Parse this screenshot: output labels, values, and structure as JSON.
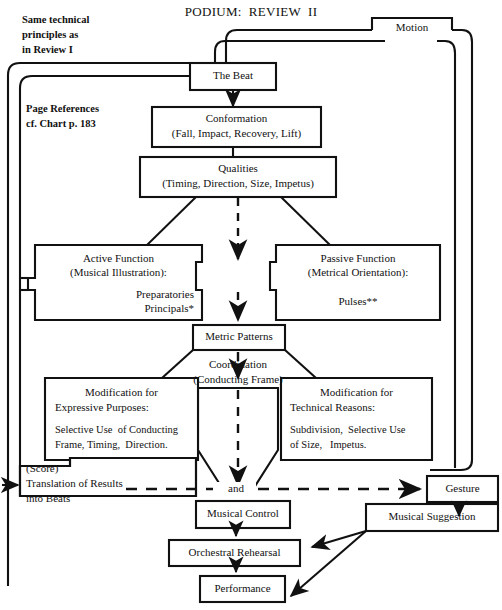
{
  "title": "PODIUM:  REVIEW  II",
  "notes": [
    {
      "id": "same-technical-principles",
      "text": "Same technical\nprinciples as\nin Review I"
    },
    {
      "id": "page-references",
      "text": "Page References\ncf. Chart p. 183"
    }
  ],
  "nodes": {
    "motion": {
      "label": "Motion"
    },
    "the_beat": {
      "label": "The Beat"
    },
    "conformation": {
      "line1": "Conformation",
      "line2": "(Fall, Impact, Recovery, Lift)"
    },
    "qualities": {
      "line1": "Qualities",
      "line2": "(Timing, Direction, Size, Impetus)"
    },
    "active_function": {
      "line1": "Active Function",
      "line2": "(Musical Illustration):",
      "line3": "Preparatories",
      "line4": "Principals*"
    },
    "passive_function": {
      "line1": "Passive Function",
      "line2": "(Metrical Orientation):",
      "line3": "Pulses**"
    },
    "metric_patterns": {
      "label": "Metric Patterns"
    },
    "coordination": {
      "line1": "Coordination",
      "line2": "(Conducting Frame)"
    },
    "modification_expressive": {
      "line1": "Modification for",
      "line2": "Expressive Purposes:",
      "line3": "Selective Use  of Conducting",
      "line4": "Frame, Timing,  Direction."
    },
    "modification_technical": {
      "line1": "Modification for",
      "line2": "Technical Reasons:",
      "line3": "Subdivision,  Selective Use",
      "line4": "of Size,   Impetus."
    },
    "score_translation": {
      "line1": "(Score)",
      "line2": "Translation of Results",
      "line3": "into Beats"
    },
    "and_junction": {
      "label": "and"
    },
    "musical_control": {
      "label": "Musical Control"
    },
    "gesture": {
      "label": "Gesture"
    },
    "musical_suggestion": {
      "label": "Musical Suggestion"
    },
    "orchestral_rehearsal": {
      "label": "Orchestral Rehearsal"
    },
    "performance": {
      "label": "Performance"
    }
  },
  "colors": {
    "stroke": "#111111",
    "text": "#111111",
    "background": "#ffffff"
  }
}
